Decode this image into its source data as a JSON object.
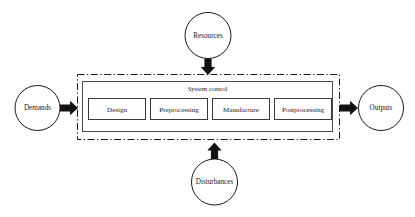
{
  "diagram": {
    "background_color": "#ffffff",
    "line_color": "#1a1a1a",
    "arrow_color": "#111111",
    "boundary": {
      "label": "system-boundary",
      "style": "dash-dot"
    },
    "panel": {
      "label": "System control"
    },
    "stages": [
      {
        "id": "design",
        "label": "Design"
      },
      {
        "id": "preprocessing",
        "label": "Preprocessing"
      },
      {
        "id": "manufacture",
        "label": "Manufacture"
      },
      {
        "id": "postprocessing",
        "label": "Postprocessing"
      }
    ],
    "nodes": [
      {
        "id": "demands",
        "label": "Demands",
        "position": "left"
      },
      {
        "id": "resources",
        "label": "Resources",
        "position": "top"
      },
      {
        "id": "disturbances",
        "label": "Disturbances",
        "position": "bottom"
      },
      {
        "id": "outputs",
        "label": "Outputs",
        "position": "right"
      }
    ],
    "arrows": [
      {
        "id": "demands-to-system",
        "direction": "right",
        "from": "Demands",
        "to": "System control"
      },
      {
        "id": "resources-to-system",
        "direction": "down",
        "from": "Resources",
        "to": "System control"
      },
      {
        "id": "disturbances-to-system",
        "direction": "up",
        "from": "Disturbances",
        "to": "System control"
      },
      {
        "id": "system-to-outputs",
        "direction": "right",
        "from": "System control",
        "to": "Outputs"
      }
    ]
  }
}
